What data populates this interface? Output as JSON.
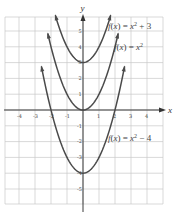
{
  "chart_data": {
    "type": "line",
    "title": "",
    "xlabel": "x",
    "ylabel": "y",
    "xlim": [
      -4.9,
      5
    ],
    "ylim": [
      -5.9,
      5.8
    ],
    "grid": true,
    "x_ticks": [
      -4,
      -3,
      -2,
      -1,
      1,
      2,
      3,
      4
    ],
    "y_ticks": [
      5,
      4,
      3,
      2,
      1,
      -1,
      -2,
      -3,
      -4,
      -5
    ],
    "x_tick_labels": [
      "-4",
      "-3",
      "-2",
      "-1",
      "1",
      "2",
      "3",
      "4"
    ],
    "y_tick_labels": [
      "5",
      "4",
      "3",
      "2",
      "1",
      "-1",
      "-2",
      "-3",
      "-4",
      "-5"
    ],
    "series": [
      {
        "name": "f(x) = x^2 + 3",
        "label_main": "f(x) = x",
        "label_exp": "2",
        "label_tail": " + 3",
        "x": [
          -1.73,
          -1.5,
          -1,
          -0.5,
          0,
          0.5,
          1,
          1.5,
          1.73
        ],
        "values": [
          6.0,
          5.25,
          4,
          3.25,
          3,
          3.25,
          4,
          5.25,
          6.0
        ]
      },
      {
        "name": "f(x) = x^2",
        "label_main": "f(x) = x",
        "label_exp": "2",
        "label_tail": "",
        "x": [
          -2.2,
          -2,
          -1.5,
          -1,
          -0.5,
          0,
          0.5,
          1,
          1.5,
          2,
          2.2
        ],
        "values": [
          4.84,
          4,
          2.25,
          1,
          0.25,
          0,
          0.25,
          1,
          2.25,
          4,
          4.84
        ]
      },
      {
        "name": "f(x) = x^2 - 4",
        "label_main": "f(x) = x",
        "label_exp": "2",
        "label_tail": " − 4",
        "x": [
          -2.6,
          -2,
          -1.5,
          -1,
          -0.5,
          0,
          0.5,
          1,
          1.5,
          2,
          2.6
        ],
        "values": [
          2.76,
          0,
          -1.75,
          -3,
          -3.75,
          -4,
          -3.75,
          -3,
          -1.75,
          0,
          2.76
        ]
      }
    ]
  },
  "axes": {
    "x_label": "x",
    "y_label": "y"
  }
}
